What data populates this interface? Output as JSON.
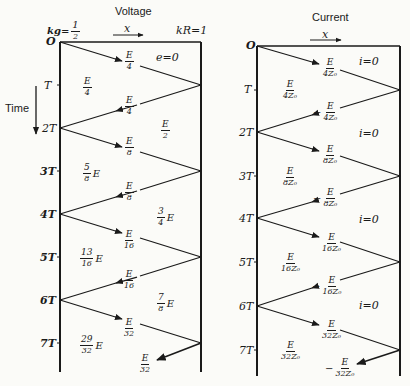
{
  "voltage": {
    "title": "Voltage",
    "x_label": "x",
    "k_g": "kₐ=½",
    "k_g_label": "kg=",
    "k_g_num": "1",
    "k_g_den": "2",
    "k_R": "kR=1",
    "zone_zero": "e=0",
    "time_ticks": [
      "O",
      "T",
      "2T",
      "3T",
      "4T",
      "5T",
      "6T",
      "7T"
    ],
    "waves": [
      {
        "num": "E",
        "den": "4",
        "sign": ""
      },
      {
        "num": "E",
        "den": "4",
        "sign": ""
      },
      {
        "num": "E",
        "den": "8",
        "sign": ""
      },
      {
        "num": "E",
        "den": "8",
        "sign": ""
      },
      {
        "num": "E",
        "den": "16",
        "sign": ""
      },
      {
        "num": "E",
        "den": "16",
        "sign": ""
      },
      {
        "num": "E",
        "den": "32",
        "sign": ""
      },
      {
        "num": "E",
        "den": "32",
        "sign": ""
      }
    ],
    "regions_left": [
      {
        "num": "E",
        "den": "4",
        "tail": ""
      },
      {
        "num": "5",
        "den": "8",
        "tail": "E"
      },
      {
        "num": "13",
        "den": "16",
        "tail": "E"
      },
      {
        "num": "29",
        "den": "32",
        "tail": "E"
      }
    ],
    "regions_right": [
      {
        "num": "E",
        "den": "2",
        "tail": ""
      },
      {
        "num": "3",
        "den": "4",
        "tail": "E"
      },
      {
        "num": "7",
        "den": "8",
        "tail": "E"
      }
    ]
  },
  "current": {
    "title": "Current",
    "x_label": "x",
    "zone_zero": "i=0",
    "time_ticks": [
      "O",
      "T",
      "2T",
      "3T",
      "4T",
      "5T",
      "6T",
      "7T"
    ],
    "waves": [
      {
        "num": "E",
        "den": "4Z₀",
        "sign": ""
      },
      {
        "num": "E",
        "den": "4Z₀",
        "sign": "−"
      },
      {
        "num": "E",
        "den": "8Z₀",
        "sign": ""
      },
      {
        "num": "E",
        "den": "8Z₀",
        "sign": "−"
      },
      {
        "num": "E",
        "den": "16Z₀",
        "sign": ""
      },
      {
        "num": "E",
        "den": "16Z₀",
        "sign": "−"
      },
      {
        "num": "E",
        "den": "32Z₀",
        "sign": ""
      },
      {
        "num": "E",
        "den": "32Z₀",
        "sign": "−"
      }
    ],
    "regions_left": [
      {
        "num": "E",
        "den": "4Z₀"
      },
      {
        "num": "E",
        "den": "8Z₀"
      },
      {
        "num": "E",
        "den": "16Z₀"
      },
      {
        "num": "E",
        "den": "32Z₀"
      }
    ],
    "regions_right": [
      "i=0",
      "i=0",
      "i=0",
      "i=0"
    ]
  },
  "time_axis_label": "Time"
}
